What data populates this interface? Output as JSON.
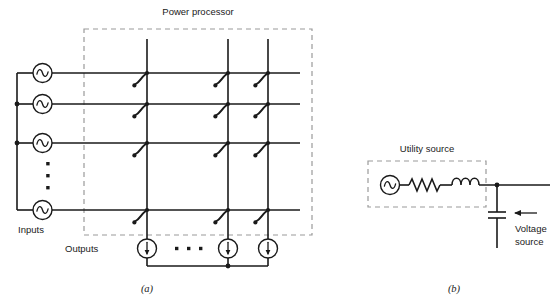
{
  "figure": {
    "panels": [
      {
        "id": "a",
        "caption": "(a)",
        "box_label": "Power processor",
        "inputs_label": "Inputs",
        "outputs_label": "Outputs",
        "input_source_icon": "ac-source-icon",
        "output_source_icon": "current-source-icon",
        "switch_icon": "switch-icon",
        "vertical_ellipsis": "⋮",
        "horizontal_ellipsis": "• • •",
        "input_count_visible": 4,
        "output_count_visible": 3,
        "switch_count_visible": 12
      },
      {
        "id": "b",
        "caption": "(b)",
        "box_label": "Utility source",
        "voltage_source_label_line1": "Voltage",
        "voltage_source_label_line2": "source",
        "ac_source_icon": "ac-source-icon",
        "resistor_icon": "resistor-icon",
        "inductor_icon": "inductor-icon",
        "capacitor_icon": "capacitor-icon",
        "pointer_icon": "left-arrow-icon"
      }
    ]
  },
  "colors": {
    "ink": "#1a1a1a",
    "dashed_border": "#9a9a9a",
    "background": "#ffffff"
  }
}
